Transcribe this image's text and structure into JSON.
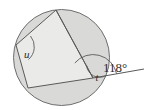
{
  "figure": {
    "background_color": "#ffffff",
    "circle": {
      "name": "circle-outline",
      "cx": 61.5,
      "cy": 57.5,
      "r": 48,
      "fill_color": "#d8d8d6",
      "stroke_color": "#6e6e6e"
    },
    "polygon": {
      "name": "inscribed-quadrilateral",
      "fill_color": "#e8e8e6",
      "stroke_color": "#5a5a5a",
      "points": "56,10 16,45 28,88 93,78",
      "vertices": [
        {
          "name": "vertex-top",
          "x": 56,
          "y": 10
        },
        {
          "name": "vertex-left",
          "x": 16,
          "y": 45
        },
        {
          "name": "vertex-bottom-left",
          "x": 28,
          "y": 88
        },
        {
          "name": "vertex-right",
          "x": 93,
          "y": 78
        }
      ]
    },
    "diagonal": {
      "name": "diagonal-top-to-right",
      "x1": 56,
      "y1": 10,
      "x2": 93,
      "y2": 78,
      "stroke_color": "#5a5a5a"
    },
    "extension_ray": {
      "name": "extension-ray-right",
      "x1": 93,
      "y1": 78,
      "x2": 144,
      "y2": 69,
      "stroke_color": "#5a5a5a"
    },
    "angle_arcs": [
      {
        "name": "angle-arc-u",
        "label_name": "angle-label-u",
        "label": "u",
        "label_x": 25,
        "label_y": 57,
        "arc_path": "M 29.5 36.5 A 16 16 0 0 1 27 58",
        "stroke_color": "#5a5a5a"
      },
      {
        "name": "angle-arc-t",
        "label_name": "angle-label-t",
        "label": "t",
        "label_x": 97,
        "label_y": 81,
        "arc_path": "M 81.5 72.6 A 13 13 0 0 0 105.8 75.7",
        "stroke_color": "#5a5a5a"
      },
      {
        "name": "angle-arc-118",
        "label_name": "angle-label-118",
        "label": "118°",
        "label_x": 108,
        "label_y": 70,
        "arc_path": "M 69.2 73.6 A 24 24 0 0 1 116.6 73.8",
        "stroke_color": "#5a5a5a"
      }
    ],
    "labels": {
      "angle_u": "u",
      "angle_t": "t",
      "angle_exterior": "118°",
      "degree_symbol": "°"
    }
  }
}
